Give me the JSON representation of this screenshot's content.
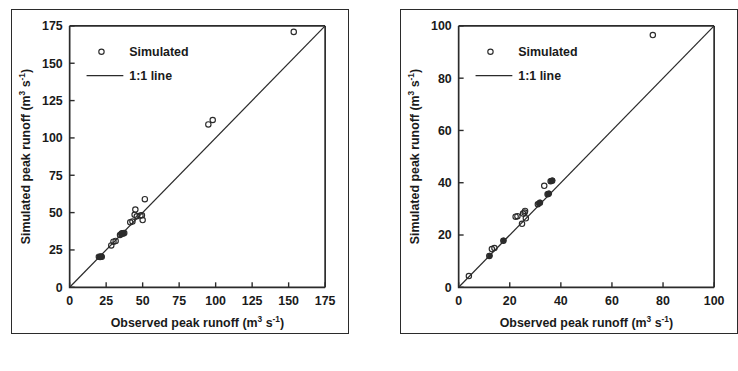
{
  "figure": {
    "background_color": "#ffffff",
    "ink_color": "#2b2b2b",
    "panel_count": 2,
    "caption_partial": ""
  },
  "chart_data": [
    {
      "id": "left-panel",
      "type": "scatter",
      "title": "",
      "xlabel": "Observed peak runoff (m3 s-1)",
      "xlabel_parts": {
        "main": "Observed peak runoff (m",
        "sup1": "3",
        "mid": " s",
        "sup2": "-1",
        "tail": ")"
      },
      "ylabel": "Simulated peak runoff (m3 s-1)",
      "ylabel_parts": {
        "main": "Simulated peak runoff (m",
        "sup1": "3",
        "mid": " s",
        "sup2": "-1",
        "tail": ")"
      },
      "xlim": [
        0,
        175
      ],
      "ylim": [
        0,
        175
      ],
      "xticks": [
        0,
        25,
        50,
        75,
        100,
        125,
        150,
        175
      ],
      "yticks": [
        0,
        25,
        50,
        75,
        100,
        125,
        150,
        175
      ],
      "xticklabels": [
        "0",
        "25",
        "50",
        "75",
        "100",
        "125",
        "150",
        "175"
      ],
      "yticklabels": [
        "0",
        "25",
        "50",
        "75",
        "100",
        "125",
        "150",
        "175"
      ],
      "grid": false,
      "legend_position": "upper-left",
      "legend": [
        {
          "label": "Simulated",
          "marker": "open-circle"
        },
        {
          "label": "1:1 line",
          "marker": "line"
        }
      ],
      "reference_line": {
        "name": "1:1 line",
        "from": [
          0,
          0
        ],
        "to": [
          175,
          175
        ]
      },
      "series": [
        {
          "name": "Simulated",
          "marker": "open-circle",
          "points": [
            [
              20.0,
              20.5
            ],
            [
              20.8,
              20.3
            ],
            [
              21.5,
              20.6
            ],
            [
              22.0,
              20.4
            ],
            [
              28.5,
              28.0
            ],
            [
              30.0,
              30.5
            ],
            [
              31.5,
              31.0
            ],
            [
              34.5,
              35.0
            ],
            [
              35.5,
              35.8
            ],
            [
              36.0,
              36.2
            ],
            [
              36.8,
              36.0
            ],
            [
              37.4,
              36.4
            ],
            [
              41.5,
              43.5
            ],
            [
              43.0,
              44.0
            ],
            [
              44.5,
              48.5
            ],
            [
              45.0,
              52.0
            ],
            [
              46.0,
              47.5
            ],
            [
              48.5,
              48.0
            ],
            [
              49.5,
              48.2
            ],
            [
              50.0,
              45.0
            ],
            [
              51.5,
              59.0
            ],
            [
              95.0,
              109.0
            ],
            [
              98.0,
              112.0
            ],
            [
              153.5,
              171.0
            ]
          ]
        },
        {
          "name": "Simulated (overlapping cluster)",
          "marker": "filled-circle",
          "points": [
            [
              20.4,
              20.4
            ],
            [
              21.2,
              20.5
            ],
            [
              35.2,
              35.6
            ],
            [
              36.2,
              36.1
            ],
            [
              36.9,
              36.3
            ]
          ]
        }
      ]
    },
    {
      "id": "right-panel",
      "type": "scatter",
      "title": "",
      "xlabel": "Observed peak runoff (m3 s-1)",
      "xlabel_parts": {
        "main": "Observed peak runoff (m",
        "sup1": "3",
        "mid": " s",
        "sup2": "-1",
        "tail": ")"
      },
      "ylabel": "Simulated peak runoff (m3 s-1)",
      "ylabel_parts": {
        "main": "Simulated peak runoff (m",
        "sup1": "3",
        "mid": " s",
        "sup2": "-1",
        "tail": ")"
      },
      "xlim": [
        0,
        100
      ],
      "ylim": [
        0,
        100
      ],
      "xticks": [
        0,
        20,
        40,
        60,
        80,
        100
      ],
      "yticks": [
        0,
        20,
        40,
        60,
        80,
        100
      ],
      "xticklabels": [
        "0",
        "20",
        "40",
        "60",
        "80",
        "100"
      ],
      "yticklabels": [
        "0",
        "20",
        "40",
        "60",
        "80",
        "100"
      ],
      "grid": false,
      "legend_position": "upper-left",
      "legend": [
        {
          "label": "Simulated",
          "marker": "open-circle"
        },
        {
          "label": "1:1 line",
          "marker": "line"
        }
      ],
      "reference_line": {
        "name": "1:1 line",
        "from": [
          0,
          0
        ],
        "to": [
          100,
          100
        ]
      },
      "series": [
        {
          "name": "Simulated",
          "marker": "open-circle",
          "points": [
            [
              4.0,
              4.3
            ],
            [
              12.0,
              12.0
            ],
            [
              13.0,
              14.6
            ],
            [
              14.0,
              15.0
            ],
            [
              17.5,
              17.8
            ],
            [
              22.3,
              27.0
            ],
            [
              23.0,
              27.2
            ],
            [
              24.8,
              24.3
            ],
            [
              25.2,
              28.2
            ],
            [
              25.8,
              28.6
            ],
            [
              26.0,
              29.2
            ],
            [
              26.3,
              26.4
            ],
            [
              31.0,
              31.8
            ],
            [
              31.8,
              32.3
            ],
            [
              33.5,
              38.8
            ],
            [
              34.8,
              35.6
            ],
            [
              35.2,
              35.8
            ],
            [
              36.0,
              40.6
            ],
            [
              36.6,
              40.8
            ],
            [
              76.0,
              96.5
            ]
          ]
        },
        {
          "name": "Simulated (overlapping cluster)",
          "marker": "filled-circle",
          "points": [
            [
              12.2,
              12.1
            ],
            [
              17.6,
              17.9
            ],
            [
              31.3,
              32.0
            ],
            [
              31.9,
              32.4
            ],
            [
              35.0,
              35.7
            ],
            [
              35.4,
              35.9
            ],
            [
              36.2,
              40.7
            ],
            [
              36.7,
              40.9
            ]
          ]
        }
      ]
    }
  ]
}
